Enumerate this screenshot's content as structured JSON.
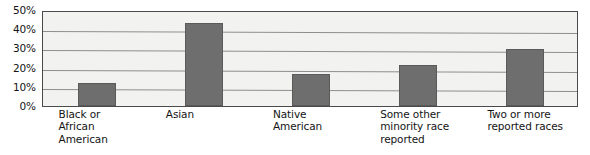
{
  "chart_data": {
    "type": "bar",
    "title": "",
    "subtitle": "",
    "xlabel": "",
    "ylabel": "",
    "categories": [
      "Black or\nAfrican\nAmerican",
      "Asian",
      "Native\nAmerican",
      "Some other\nminority race\nreported",
      "Two or more\nreported races"
    ],
    "values": [
      12,
      43,
      16.5,
      21.5,
      29.5
    ],
    "ylim": [
      0,
      50
    ],
    "ytick_labels": [
      "50%",
      "40%",
      "30%",
      "20%",
      "10%",
      "0%"
    ],
    "ytick_values": [
      50,
      40,
      30,
      20,
      10,
      0
    ],
    "grid": true,
    "legend": "none",
    "bar_color": "#6e6e6e",
    "plot_background": "#f2f2f1",
    "plot_border_color": "#4a4a4a",
    "gridline_color": "#8e8e8e"
  }
}
